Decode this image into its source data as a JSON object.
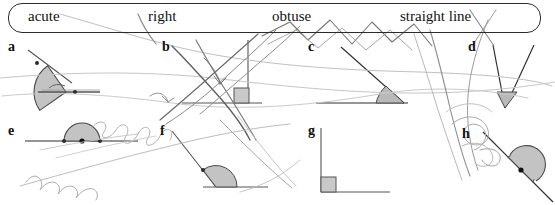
{
  "page": {
    "background": "#ffffff",
    "width": 555,
    "height": 205
  },
  "wordbank": {
    "name": "word-bank",
    "border_color": "#2b2b2b",
    "items": [
      {
        "label": "acute",
        "x": 28
      },
      {
        "label": "right",
        "x": 148
      },
      {
        "label": "obtuse",
        "x": 272
      },
      {
        "label": "straight line",
        "x": 400
      }
    ]
  },
  "diagrams": [
    {
      "letter": "a",
      "x": 8,
      "y": 40,
      "angle_type": "obtuse",
      "marker": "sector"
    },
    {
      "letter": "b",
      "x": 162,
      "y": 40,
      "angle_type": "right",
      "marker": "square"
    },
    {
      "letter": "c",
      "x": 308,
      "y": 40,
      "angle_type": "acute",
      "marker": "sector"
    },
    {
      "letter": "d",
      "x": 468,
      "y": 40,
      "angle_type": "acute",
      "marker": "sector"
    },
    {
      "letter": "e",
      "x": 8,
      "y": 124,
      "angle_type": "straight line",
      "marker": "semicircle"
    },
    {
      "letter": "f",
      "x": 160,
      "y": 124,
      "angle_type": "obtuse",
      "marker": "sector"
    },
    {
      "letter": "g",
      "x": 308,
      "y": 124,
      "angle_type": "right",
      "marker": "square"
    },
    {
      "letter": "h",
      "x": 462,
      "y": 127,
      "angle_type": "straight line",
      "marker": "semicircle"
    }
  ],
  "ink": {
    "name": "handwritten-ink-overlay",
    "stroke_color_dark": "#6a6a6a",
    "stroke_color_light": "#b8b8b8",
    "description": "scribbled pen marks drawn over the worksheet"
  },
  "style": {
    "line_color": "#555555",
    "shade_fill": "#bdbdbd",
    "shade_stroke": "#4a4a4a"
  }
}
